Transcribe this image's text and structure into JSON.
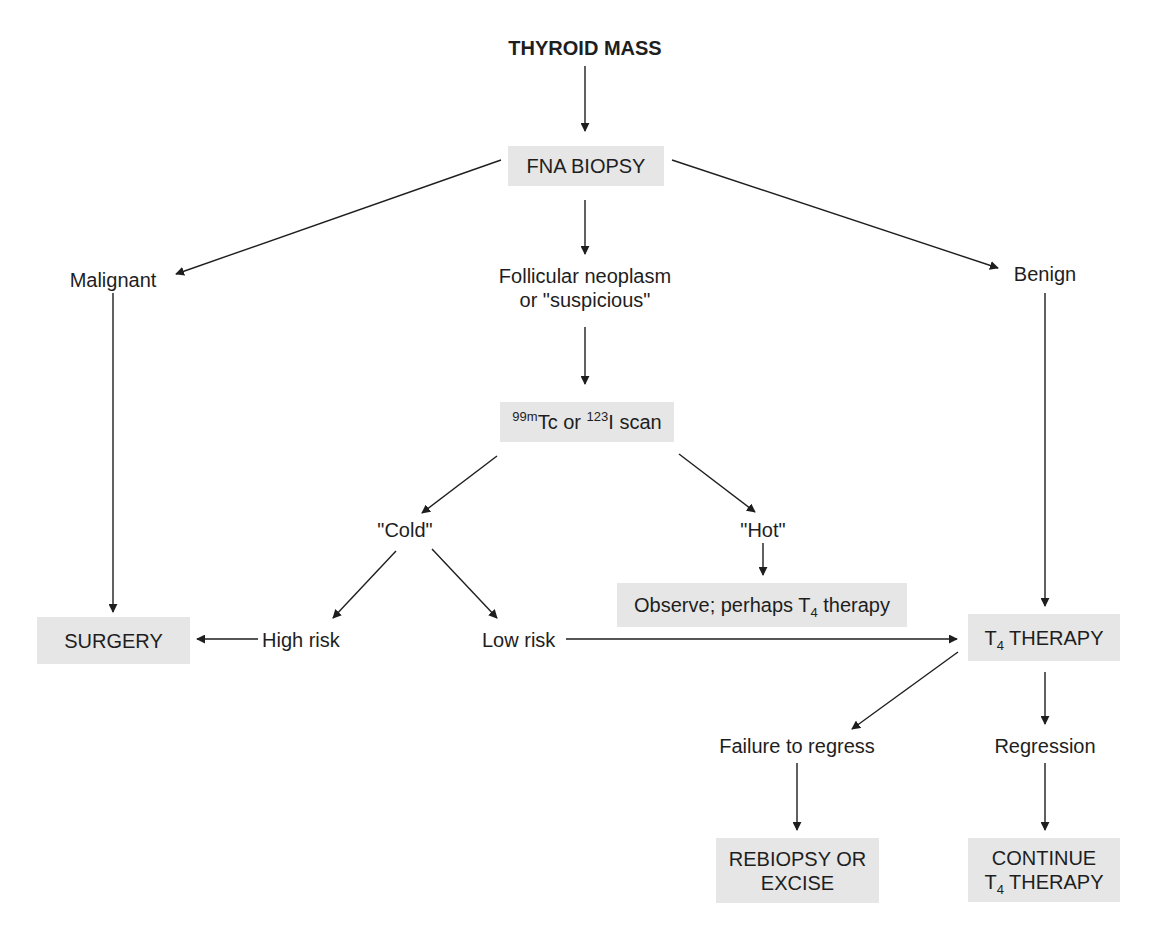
{
  "diagram": {
    "title": "THYROID MASS",
    "nodes": {
      "fna_biopsy": "FNA BIOPSY",
      "malignant": "Malignant",
      "follicular_line1": "Follicular neoplasm",
      "follicular_line2": "or \"suspicious\"",
      "benign": "Benign",
      "scan": {
        "sup1": "99m",
        "text1": "Tc or ",
        "sup2": "123",
        "text2": "I scan"
      },
      "cold": "\"Cold\"",
      "hot": "\"Hot\"",
      "observe": {
        "text1": "Observe; perhaps T",
        "sub": "4",
        "text2": " therapy"
      },
      "surgery": "SURGERY",
      "high_risk": "High risk",
      "low_risk": "Low risk",
      "t4_therapy": {
        "text1": "T",
        "sub": "4",
        "text2": " THERAPY"
      },
      "failure_to_regress": "Failure to regress",
      "regression": "Regression",
      "rebiopsy_line1": "REBIOPSY OR",
      "rebiopsy_line2": "EXCISE",
      "continue_line1": "CONTINUE",
      "continue_line2": {
        "text1": "T",
        "sub": "4",
        "text2": " THERAPY"
      }
    },
    "edges": [
      [
        "THYROID MASS",
        "FNA BIOPSY"
      ],
      [
        "FNA BIOPSY",
        "Malignant"
      ],
      [
        "FNA BIOPSY",
        "Follicular neoplasm or \"suspicious\""
      ],
      [
        "FNA BIOPSY",
        "Benign"
      ],
      [
        "Malignant",
        "SURGERY"
      ],
      [
        "Follicular neoplasm or \"suspicious\"",
        "99mTc or 123I scan"
      ],
      [
        "99mTc or 123I scan",
        "\"Cold\""
      ],
      [
        "99mTc or 123I scan",
        "\"Hot\""
      ],
      [
        "\"Hot\"",
        "Observe; perhaps T4 therapy"
      ],
      [
        "\"Cold\"",
        "High risk"
      ],
      [
        "\"Cold\"",
        "Low risk"
      ],
      [
        "High risk",
        "SURGERY"
      ],
      [
        "Low risk",
        "T4 THERAPY"
      ],
      [
        "Benign",
        "T4 THERAPY"
      ],
      [
        "T4 THERAPY",
        "Failure to regress"
      ],
      [
        "T4 THERAPY",
        "Regression"
      ],
      [
        "Failure to regress",
        "REBIOPSY OR EXCISE"
      ],
      [
        "Regression",
        "CONTINUE T4 THERAPY"
      ]
    ],
    "colors": {
      "box_fill": "#e6e6e6",
      "line": "#1e1e1e",
      "text": "#1e1e1e"
    }
  }
}
